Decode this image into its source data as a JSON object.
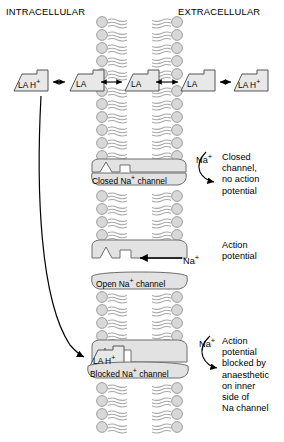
{
  "figure": {
    "type": "biology-diagram",
    "headers": {
      "left": "INTRACELLULAR",
      "right": "EXTRACELLULAR"
    }
  },
  "equilibrium_row": {
    "description": "Local anaesthetic equilibrium across the membrane",
    "species": [
      {
        "id": "la-h-intracellular",
        "label": "LA H",
        "charge": "+",
        "side": "intracellular"
      },
      {
        "id": "la-intracellular",
        "label": "LA",
        "charge": "",
        "side": "intracellular"
      },
      {
        "id": "la-membrane",
        "label": "LA",
        "charge": "",
        "side": "membrane"
      },
      {
        "id": "la-extracellular",
        "label": "LA",
        "charge": "",
        "side": "extracellular"
      },
      {
        "id": "la-h-extracellular",
        "label": "LA H",
        "charge": "+",
        "side": "extracellular"
      }
    ],
    "arrows": "double-headed equilibrium arrows"
  },
  "channels": [
    {
      "id": "closed",
      "label": "Closed Na",
      "label_sup": "+",
      "label_tail": " channel",
      "state": "closed",
      "ion_label": "Na",
      "ion_sup": "+",
      "annotation": "Closed\nchannel,\nno action\npotential"
    },
    {
      "id": "open",
      "label": "Open Na",
      "label_sup": "+",
      "label_tail": " channel",
      "state": "open",
      "ion_label": "Na",
      "ion_sup": "+",
      "annotation": "Action\npotential"
    },
    {
      "id": "blocked",
      "label": "Blocked Na",
      "label_sup": "+",
      "label_tail": " channel",
      "state": "blocked",
      "ion_label": "Na",
      "ion_sup": "+",
      "blocker_label": "LA H",
      "blocker_sup": "+",
      "annotation": "Action\npotential\nblocked by\nanaesthetic\non inner\nside of\nNa  channel",
      "annotation_last_line_sup": "+"
    }
  ],
  "colors": {
    "stroke": "#000000",
    "lipid_head_fill": "#d8d8d8",
    "lipid_head_stroke": "#8a8a8a",
    "lipid_tail": "#a8a8a8",
    "protein_fill": "#e2e2e2",
    "protein_stroke": "#6e6e6e",
    "molecule_fill": "#e8e8e8",
    "molecule_stroke": "#555555",
    "background": "#ffffff"
  }
}
